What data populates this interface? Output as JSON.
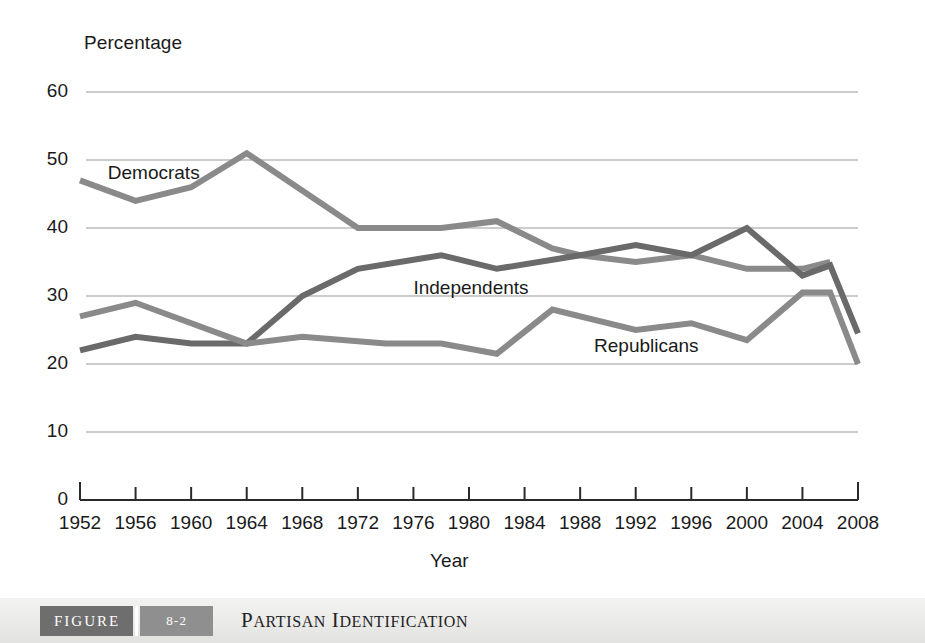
{
  "figure": {
    "label": "FIGURE",
    "number": "8-2",
    "title_parts": [
      {
        "big": "P",
        "small": "ARTISAN"
      },
      {
        "big": "I",
        "small": "DENTIFICATION"
      }
    ],
    "title_plain": "Partisan Identification"
  },
  "colors": {
    "democrats": "#8a8a8a",
    "independents": "#6a6a6a",
    "republicans": "#8a8a8a",
    "gridline": "#9a9a9a",
    "axis": "#2a2a2a",
    "text": "#1a1a1a",
    "caption_bar": "#ececeb",
    "caption_figure_block": "#6e6e6e",
    "caption_number_block": "#8f8f8f"
  },
  "chart_data": {
    "type": "line",
    "title": "Partisan Identification",
    "xlabel": "Year",
    "ylabel": "Percentage",
    "xlim": [
      1952,
      2008
    ],
    "ylim": [
      0,
      60
    ],
    "ytick_step": 10,
    "grid": true,
    "legend": "inline-labels",
    "x": [
      1952,
      1956,
      1960,
      1964,
      1966,
      1968,
      1970,
      1974,
      1978,
      1982,
      1986,
      1990,
      1992,
      1996,
      2000,
      2004,
      2006,
      2008
    ],
    "xticks": [
      1952,
      1956,
      1960,
      1964,
      1968,
      1972,
      1976,
      1980,
      1984,
      1988,
      1992,
      1996,
      2000,
      2004,
      2008
    ],
    "yticks": [
      0,
      10,
      20,
      30,
      40,
      50,
      60
    ],
    "series": [
      {
        "name": "Democrats",
        "color": "#8a8a8a",
        "label_x": 1954,
        "label_y": 48,
        "points": [
          {
            "x": 1952,
            "y": 47
          },
          {
            "x": 1956,
            "y": 44
          },
          {
            "x": 1960,
            "y": 46
          },
          {
            "x": 1964,
            "y": 51
          },
          {
            "x": 1972,
            "y": 40
          },
          {
            "x": 1978,
            "y": 40
          },
          {
            "x": 1982,
            "y": 41
          },
          {
            "x": 1986,
            "y": 37
          },
          {
            "x": 1988,
            "y": 36
          },
          {
            "x": 1992,
            "y": 35
          },
          {
            "x": 1996,
            "y": 36
          },
          {
            "x": 2000,
            "y": 34
          },
          {
            "x": 2004,
            "y": 34
          },
          {
            "x": 2006,
            "y": 35
          }
        ]
      },
      {
        "name": "Independents",
        "color": "#6a6a6a",
        "label_x": 1976,
        "label_y": 31,
        "points": [
          {
            "x": 1952,
            "y": 22
          },
          {
            "x": 1956,
            "y": 24
          },
          {
            "x": 1960,
            "y": 23
          },
          {
            "x": 1964,
            "y": 23
          },
          {
            "x": 1968,
            "y": 30
          },
          {
            "x": 1972,
            "y": 34
          },
          {
            "x": 1978,
            "y": 36
          },
          {
            "x": 1982,
            "y": 34
          },
          {
            "x": 1988,
            "y": 36
          },
          {
            "x": 1992,
            "y": 37.5
          },
          {
            "x": 1996,
            "y": 36
          },
          {
            "x": 2000,
            "y": 40
          },
          {
            "x": 2004,
            "y": 33
          },
          {
            "x": 2006,
            "y": 34.5
          },
          {
            "x": 2008,
            "y": 24.5
          }
        ]
      },
      {
        "name": "Republicans",
        "color": "#8a8a8a",
        "label_x": 1989,
        "label_y": 22.5,
        "points": [
          {
            "x": 1952,
            "y": 27
          },
          {
            "x": 1956,
            "y": 29
          },
          {
            "x": 1964,
            "y": 23
          },
          {
            "x": 1968,
            "y": 24
          },
          {
            "x": 1974,
            "y": 23
          },
          {
            "x": 1978,
            "y": 23
          },
          {
            "x": 1982,
            "y": 21.5
          },
          {
            "x": 1986,
            "y": 28
          },
          {
            "x": 1992,
            "y": 25
          },
          {
            "x": 1996,
            "y": 26
          },
          {
            "x": 2000,
            "y": 23.5
          },
          {
            "x": 2004,
            "y": 30.5
          },
          {
            "x": 2006,
            "y": 30.5
          },
          {
            "x": 2008,
            "y": 20
          }
        ]
      }
    ]
  }
}
